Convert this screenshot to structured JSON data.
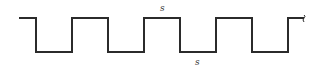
{
  "diagram": {
    "type": "square-wave",
    "stroke_color": "#2b2b2b",
    "high_y": 18,
    "low_y": 52,
    "start_x": 19,
    "transitions_x": [
      36,
      72,
      108,
      144,
      180,
      216,
      252,
      288
    ],
    "end_x": 305,
    "labels": {
      "top": "s",
      "bottom": "s"
    },
    "end_marker": "break-squiggle"
  }
}
